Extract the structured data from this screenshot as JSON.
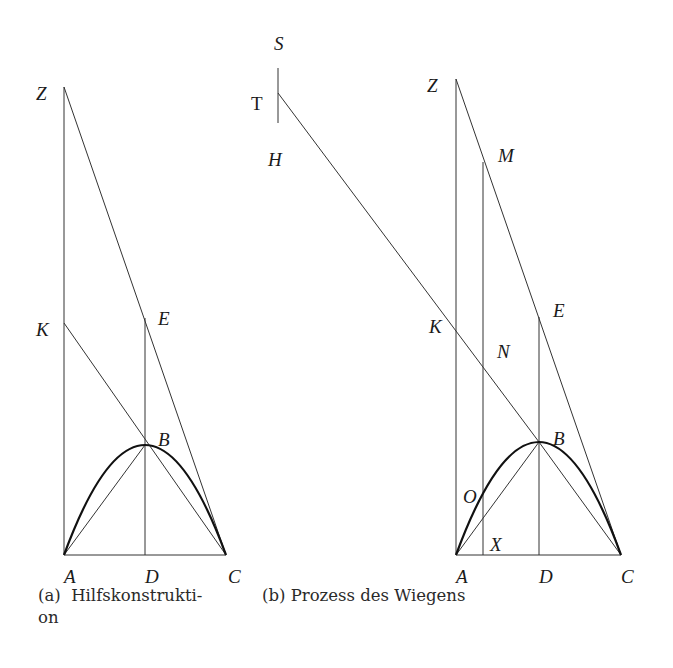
{
  "figure_a": {
    "caption": "(a)  Hilfskonstrukti-",
    "caption_line2": "on",
    "labels": {
      "Z": "Z",
      "K": "K",
      "E": "E",
      "B": "B",
      "A": "A",
      "D": "D",
      "C": "C"
    }
  },
  "figure_b": {
    "caption": "(b) Prozess des Wiegens",
    "labels": {
      "S": "S",
      "T": "T",
      "H": "H",
      "Z": "Z",
      "M": "M",
      "E": "E",
      "K": "K",
      "N": "N",
      "B": "B",
      "O": "O",
      "X": "X",
      "A": "A",
      "D": "D",
      "C": "C"
    }
  }
}
